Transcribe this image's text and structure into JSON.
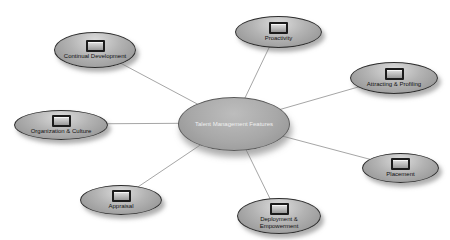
{
  "diagram": {
    "type": "hub-and-spoke",
    "center": {
      "label": "Talent Management Features"
    },
    "nodes": [
      {
        "id": "continual-development",
        "label": "Continual Development",
        "icon": "box-icon"
      },
      {
        "id": "proactivity",
        "label": "Proactivity",
        "icon": "box-icon"
      },
      {
        "id": "attracting-profiling",
        "label": "Attracting & Profiling",
        "icon": "box-icon"
      },
      {
        "id": "placement",
        "label": "Placement",
        "icon": "box-icon"
      },
      {
        "id": "deployment-empowerment",
        "label": "Deployment & Empowerment",
        "icon": "box-icon"
      },
      {
        "id": "appraisal",
        "label": "Appraisal",
        "icon": "box-icon"
      },
      {
        "id": "organization-culture",
        "label": "Organization & Culture",
        "icon": "box-icon"
      }
    ],
    "colors": {
      "background": "#ffffff",
      "ellipse_fill": "#a9a9a9",
      "ellipse_border": "#2e2e2e",
      "connector": "#a6a6a6",
      "center_text": "#efefef",
      "node_text": "#101010"
    }
  }
}
